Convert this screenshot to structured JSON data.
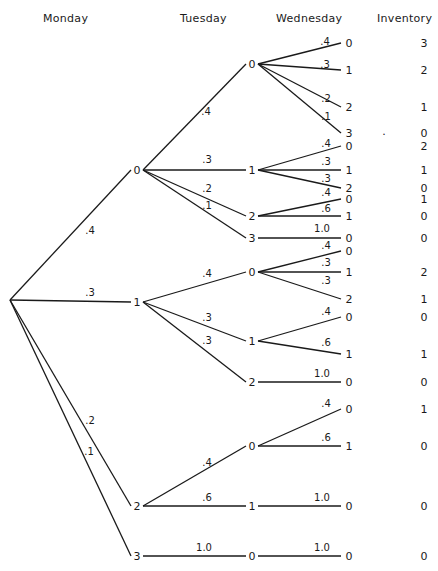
{
  "headers": {
    "monday": "Monday",
    "tuesday": "Tuesday",
    "wednesday": "Wednesday",
    "inventory": "Inventory"
  },
  "root": {
    "x": 10,
    "y": 300
  },
  "monday_nodes": [
    {
      "id": "M0",
      "label": "0",
      "x": 137,
      "y": 170,
      "prob": ".4",
      "px": 90,
      "py": 231
    },
    {
      "id": "M1",
      "label": "1",
      "x": 137,
      "y": 302,
      "prob": ".3",
      "px": 90,
      "py": 293
    },
    {
      "id": "M2",
      "label": "2",
      "x": 137,
      "y": 506,
      "prob": ".2",
      "px": 90,
      "py": 421
    },
    {
      "id": "M3",
      "label": "3",
      "x": 137,
      "y": 556,
      "prob": ".1",
      "px": 89,
      "py": 452
    }
  ],
  "tuesday_nodes": [
    {
      "id": "M0T0",
      "parent": "M0",
      "label": "0",
      "x": 252,
      "y": 64,
      "prob": ".4",
      "px": 206,
      "py": 112
    },
    {
      "id": "M0T1",
      "parent": "M0",
      "label": "1",
      "x": 252,
      "y": 170,
      "prob": ".3",
      "px": 207,
      "py": 160
    },
    {
      "id": "M0T2",
      "parent": "M0",
      "label": "2",
      "x": 252,
      "y": 216,
      "prob": ".2",
      "px": 207,
      "py": 189
    },
    {
      "id": "M0T3",
      "parent": "M0",
      "label": "3",
      "x": 252,
      "y": 238,
      "prob": ".1",
      "px": 207,
      "py": 206
    },
    {
      "id": "M1T0",
      "parent": "M1",
      "label": "0",
      "x": 252,
      "y": 272,
      "prob": ".4",
      "px": 207,
      "py": 274
    },
    {
      "id": "M1T1",
      "parent": "M1",
      "label": "1",
      "x": 252,
      "y": 341,
      "prob": ".3",
      "px": 207,
      "py": 318
    },
    {
      "id": "M1T2",
      "parent": "M1",
      "label": "2",
      "x": 252,
      "y": 382,
      "prob": ".3",
      "px": 207,
      "py": 341
    },
    {
      "id": "M2T0",
      "parent": "M2",
      "label": "0",
      "x": 252,
      "y": 446,
      "prob": ".4",
      "px": 207,
      "py": 463
    },
    {
      "id": "M2T1",
      "parent": "M2",
      "label": "1",
      "x": 252,
      "y": 506,
      "prob": ".6",
      "px": 207,
      "py": 498
    },
    {
      "id": "M3T0",
      "parent": "M3",
      "label": "0",
      "x": 252,
      "y": 556,
      "prob": "1.0",
      "px": 204,
      "py": 548
    }
  ],
  "wednesday_leaves": [
    {
      "parent": "M0T0",
      "label": "0",
      "x": 347,
      "y": 43,
      "prob": ".4",
      "px": 325,
      "py": 42,
      "inventory": "3"
    },
    {
      "parent": "M0T0",
      "label": "1",
      "x": 347,
      "y": 70,
      "prob": ".3",
      "px": 325,
      "py": 65,
      "inventory": "2"
    },
    {
      "parent": "M0T0",
      "label": "2",
      "x": 347,
      "y": 107,
      "prob": ".2",
      "px": 326,
      "py": 99,
      "inventory": "1"
    },
    {
      "parent": "M0T0",
      "label": "3",
      "x": 347,
      "y": 133,
      "prob": ".1",
      "px": 326,
      "py": 117,
      "inventory": "0"
    },
    {
      "parent": "M0T1",
      "label": "0",
      "x": 347,
      "y": 146,
      "prob": ".4",
      "px": 326,
      "py": 144,
      "inventory": "2"
    },
    {
      "parent": "M0T1",
      "label": "1",
      "x": 347,
      "y": 170,
      "prob": ".3",
      "px": 326,
      "py": 162,
      "inventory": "1"
    },
    {
      "parent": "M0T1",
      "label": "2",
      "x": 347,
      "y": 188,
      "prob": ".3",
      "px": 326,
      "py": 179,
      "inventory": "0"
    },
    {
      "parent": "M0T2",
      "label": "0",
      "x": 347,
      "y": 199,
      "prob": ".4",
      "px": 326,
      "py": 193,
      "inventory": "1"
    },
    {
      "parent": "M0T2",
      "label": "1",
      "x": 347,
      "y": 216,
      "prob": ".6",
      "px": 326,
      "py": 209,
      "inventory": "0"
    },
    {
      "parent": "M0T3",
      "label": "0",
      "x": 347,
      "y": 238,
      "prob": "1.0",
      "px": 322,
      "py": 229,
      "inventory": "0"
    },
    {
      "parent": "M1T0",
      "label": "0",
      "x": 347,
      "y": 251,
      "prob": ".4",
      "px": 326,
      "py": 246,
      "inventory": ""
    },
    {
      "parent": "M1T0",
      "label": "1",
      "x": 347,
      "y": 272,
      "prob": ".3",
      "px": 326,
      "py": 263,
      "inventory": "2"
    },
    {
      "parent": "M1T0",
      "label": "2",
      "x": 347,
      "y": 299,
      "prob": ".3",
      "px": 326,
      "py": 281,
      "inventory": "1"
    },
    {
      "parent": "M1T1",
      "label": "0",
      "x": 347,
      "y": 317,
      "prob": ".4",
      "px": 326,
      "py": 312,
      "inventory": "0"
    },
    {
      "parent": "M1T1",
      "label": "1",
      "x": 347,
      "y": 354,
      "prob": ".6",
      "px": 326,
      "py": 343,
      "inventory": "1"
    },
    {
      "parent": "M1T2",
      "label": "0",
      "x": 347,
      "y": 382,
      "prob": "1.0",
      "px": 322,
      "py": 374,
      "inventory": "0"
    },
    {
      "parent": "M2T0",
      "label": "0",
      "x": 347,
      "y": 409,
      "prob": ".4",
      "px": 326,
      "py": 404,
      "inventory": "1"
    },
    {
      "parent": "M2T0",
      "label": "1",
      "x": 347,
      "y": 446,
      "prob": ".6",
      "px": 326,
      "py": 438,
      "inventory": "0"
    },
    {
      "parent": "M2T1",
      "label": "0",
      "x": 347,
      "y": 506,
      "prob": "1.0",
      "px": 322,
      "py": 498,
      "inventory": "0"
    },
    {
      "parent": "M3T0",
      "label": "0",
      "x": 347,
      "y": 556,
      "prob": "1.0",
      "px": 322,
      "py": 548,
      "inventory": "0"
    }
  ],
  "stray_mark": {
    "x": 384,
    "y": 131,
    "text": "."
  }
}
